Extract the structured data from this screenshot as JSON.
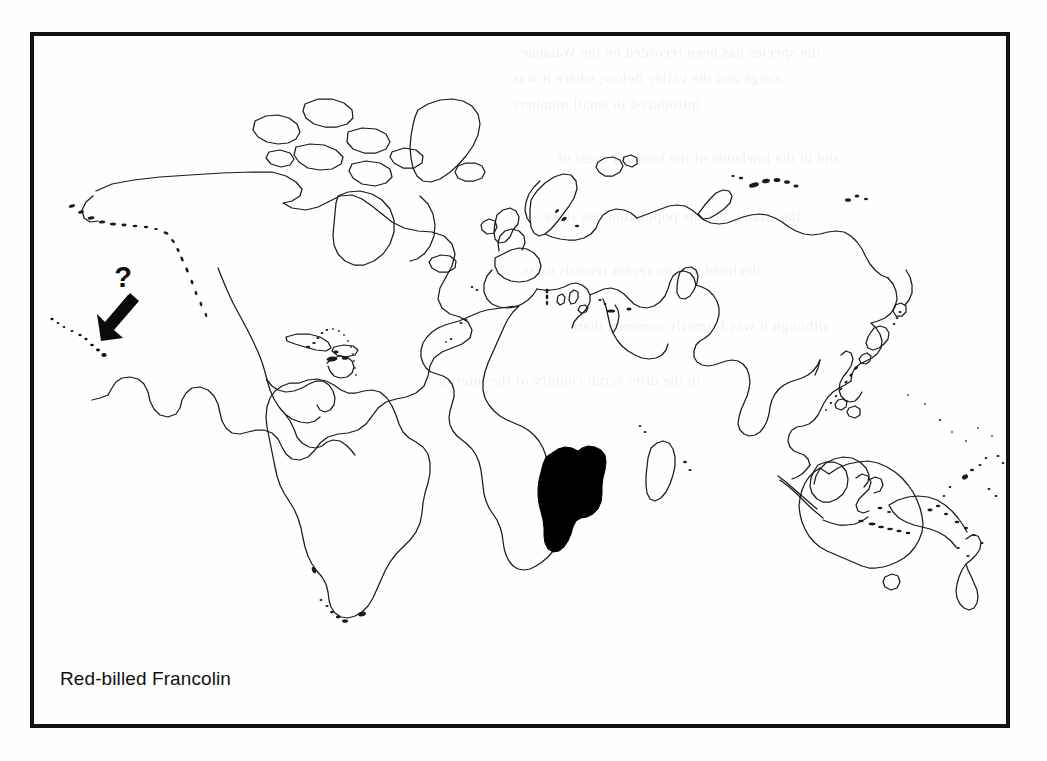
{
  "figure": {
    "kind": "distribution-map",
    "caption": "Red-billed Francolin",
    "frame": {
      "border_color": "#131313",
      "border_width_px": 4
    },
    "background_color": "#fefefe",
    "ink_color": "#1a1a1a",
    "range_fill_color": "#000000"
  },
  "annotations": {
    "query_marker": {
      "glyph": "?",
      "meaning": "uncertain / questionable record",
      "arrow_points_to": "Hawaiian Islands"
    }
  },
  "legend_regions": {
    "shaded_range_label": "Southern Africa (Namibia, Botswana, Zimbabwe, Angola)"
  },
  "ghost_text": {
    "note": "faint show-through text from the reverse side of the page",
    "lines": [
      "the species has been recorded on the Waianae",
      "range and the valley below, where it was",
      "introduced in small numbers",
      "and in the lowlands of the leeward coast of",
      "the island, but the population has since",
      "declined and no recent records exist",
      "although it was formerly common there",
      "in the drier scrub country of the interior"
    ]
  },
  "map_projection": {
    "type": "equirectangular-world",
    "lon_range": [
      -180,
      180
    ],
    "lat_range": [
      -60,
      84
    ]
  }
}
